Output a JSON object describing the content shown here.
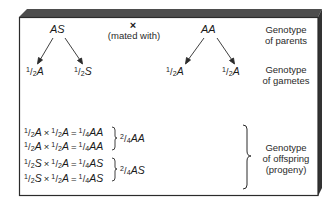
{
  "parents": {
    "left": "AS",
    "right": "AA",
    "cross_symbol": "×",
    "cross_label": "(mated with)"
  },
  "gametes": {
    "left": [
      {
        "num": "1",
        "den": "2",
        "allele": "A"
      },
      {
        "num": "1",
        "den": "2",
        "allele": "S"
      }
    ],
    "right": [
      {
        "num": "1",
        "den": "2",
        "allele": "A"
      },
      {
        "num": "1",
        "den": "2",
        "allele": "A"
      }
    ]
  },
  "offspring": {
    "equations": [
      {
        "a_num": "1",
        "a_den": "2",
        "a": "A",
        "b_num": "1",
        "b_den": "2",
        "b": "A",
        "r_num": "1",
        "r_den": "4",
        "r": "AA"
      },
      {
        "a_num": "1",
        "a_den": "2",
        "a": "A",
        "b_num": "1",
        "b_den": "2",
        "b": "A",
        "r_num": "1",
        "r_den": "4",
        "r": "AA"
      },
      {
        "a_num": "1",
        "a_den": "2",
        "a": "S",
        "b_num": "1",
        "b_den": "2",
        "b": "A",
        "r_num": "1",
        "r_den": "4",
        "r": "AS"
      },
      {
        "a_num": "1",
        "a_den": "2",
        "a": "S",
        "b_num": "1",
        "b_den": "2",
        "b": "A",
        "r_num": "1",
        "r_den": "4",
        "r": "AS"
      }
    ],
    "totals": [
      {
        "num": "2",
        "den": "4",
        "genotype": "AA"
      },
      {
        "num": "2",
        "den": "4",
        "genotype": "AS"
      }
    ],
    "times": "×",
    "equals": "="
  },
  "labels": {
    "parents": [
      "Genotype",
      "of parents"
    ],
    "gametes": [
      "Genotype",
      "of gametes"
    ],
    "offspring": [
      "Genotype",
      "of offspring",
      "(progeny)"
    ]
  },
  "colors": {
    "frame": "#2b2b2b",
    "bevel_top": "#4a4a4a",
    "bevel_side": "#333333",
    "text": "#1a1a1a"
  }
}
